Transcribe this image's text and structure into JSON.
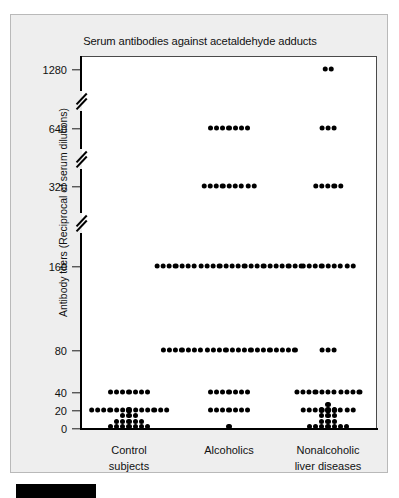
{
  "figure": {
    "title": "Serum antibodies against acetaldehyde adducts",
    "y_axis_label": "Antibody titers (Reciprocal of serum dilutions)",
    "background_color": "#eeeeee",
    "plot_background_color": "#ffffff",
    "dot_color": "#000000",
    "axis_color": "#000000"
  },
  "chart_data": {
    "type": "scatter",
    "title": "Serum antibodies against acetaldehyde adducts",
    "xlabel": "",
    "ylabel": "Antibody titers (Reciprocal of serum dilutions)",
    "plot_style": "dot plot (one dot per subject)",
    "grid": false,
    "legend": false,
    "y_scale": "broken ordinal axis with axis breaks",
    "y_ticks": [
      0,
      20,
      40,
      80,
      160,
      320,
      640,
      1280
    ],
    "y_tick_labels": [
      "0",
      "20",
      "40",
      "80",
      "160",
      "320",
      "640",
      "1280"
    ],
    "axis_breaks_between": [
      [
        40,
        80
      ],
      [
        160,
        320
      ],
      [
        320,
        640
      ],
      [
        640,
        1280
      ]
    ],
    "categories": [
      "Control subjects",
      "Alcoholics",
      "Nonalcoholic liver diseases"
    ],
    "series": [
      {
        "name": "Control subjects",
        "counts_by_titer": {
          "0": 4,
          "20": 13,
          "40": 7,
          "80": 0,
          "160": 0,
          "320": 0,
          "640": 0,
          "1280": 0
        }
      },
      {
        "name": "Alcoholics",
        "counts_by_titer": {
          "0": 1,
          "20": 7,
          "40": 7,
          "80": 22,
          "160": 24,
          "320": 9,
          "640": 7,
          "1280": 0
        }
      },
      {
        "name": "Nonalcoholic liver diseases",
        "counts_by_titer": {
          "0": 8,
          "20": 9,
          "40": 11,
          "80": 3,
          "160": 9,
          "320": 5,
          "640": 3,
          "1280": 2
        }
      }
    ],
    "stacked_at_zero": {
      "Control subjects": [
        1,
        2,
        3,
        4,
        3,
        2,
        1
      ],
      "Nonalcoholic liver diseases": [
        1,
        1,
        4,
        5,
        4,
        1,
        1
      ]
    }
  },
  "y_ticks": [
    {
      "label": "1280",
      "y": 69
    },
    {
      "label": "640",
      "y": 128
    },
    {
      "label": "320",
      "y": 186
    },
    {
      "label": "160",
      "y": 266
    },
    {
      "label": "80",
      "y": 350
    },
    {
      "label": "40",
      "y": 392
    },
    {
      "label": "20",
      "y": 410
    },
    {
      "label": "0",
      "y": 428
    }
  ],
  "axis_breaks": [
    {
      "y": 100
    },
    {
      "y": 158
    },
    {
      "y": 222
    }
  ],
  "x_groups": [
    {
      "line1": "Control",
      "line2": "subjects",
      "cx": 128
    },
    {
      "line1": "Alcoholics",
      "line2": "",
      "cx": 228
    },
    {
      "line1": "Nonalcoholic",
      "line2": "liver diseases",
      "cx": 327
    }
  ]
}
